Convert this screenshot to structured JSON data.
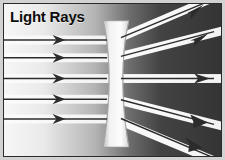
{
  "figure": {
    "title": "Light Rays",
    "width": 225,
    "height": 160
  },
  "colors": {
    "background_left": "#f4f4f4",
    "background_mid": "#b8b8b8",
    "background_right": "#3a3a3a",
    "ray_band": "#f7f7f7",
    "ray_line": "#2a2a2a",
    "lens_fill": "#ededed",
    "lens_edge": "#8e8e8e",
    "title_text": "#0d0d0d",
    "frame": "#d2d2d2",
    "border": "#2b2b2b"
  },
  "lens": {
    "name": "concave-diverging-lens",
    "center_x": 116,
    "top_y": 20,
    "bottom_y": 148,
    "top_half_width": 13,
    "waist_half_width": 6
  },
  "incoming_rays": [
    {
      "id": "ray-1",
      "y": 40,
      "arrow_x": 62,
      "band_height": 9
    },
    {
      "id": "ray-2",
      "y": 58,
      "arrow_x": 62,
      "band_height": 9
    },
    {
      "id": "ray-3",
      "y": 79,
      "arrow_x": 62,
      "band_height": 9
    },
    {
      "id": "ray-4",
      "y": 100,
      "arrow_x": 62,
      "band_height": 9
    },
    {
      "id": "ray-5",
      "y": 120,
      "arrow_x": 62,
      "band_height": 9
    }
  ],
  "outgoing_rays": [
    {
      "id": "out-ray-1",
      "start_y": 40,
      "end_x": 215,
      "end_y": 6,
      "band_height": 9
    },
    {
      "id": "out-ray-2",
      "start_y": 58,
      "end_x": 215,
      "end_y": 40,
      "band_height": 9
    },
    {
      "id": "out-ray-3",
      "start_y": 79,
      "end_x": 215,
      "end_y": 79,
      "band_height": 9
    },
    {
      "id": "out-ray-4",
      "start_y": 100,
      "end_x": 215,
      "end_y": 120,
      "band_height": 9
    },
    {
      "id": "out-ray-5",
      "start_y": 120,
      "end_x": 215,
      "end_y": 152,
      "band_height": 9
    }
  ]
}
